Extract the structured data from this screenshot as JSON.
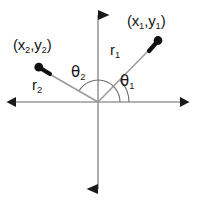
{
  "figure": {
    "width": 197,
    "height": 203,
    "background": "#ffffff",
    "axis_color": "#9a9a9a",
    "vector_color": "#9a9a9a",
    "arc_color": "#6f6f6f",
    "marker_color": "#111111",
    "text_color": "#161616"
  },
  "axes": {
    "origin": {
      "x": 98,
      "y": 102
    },
    "horizontal": {
      "name": "x-axis",
      "x1": 12,
      "y1": 102,
      "x2": 184,
      "y2": 102,
      "arrow_left": true,
      "arrow_right": true
    },
    "vertical": {
      "name": "y-axis",
      "x1": 98,
      "y1": 10,
      "x2": 98,
      "y2": 194,
      "arrow_up": true,
      "arrow_down": true
    }
  },
  "vectors": [
    {
      "id": "r1",
      "label": "r",
      "subscript": "1",
      "point_label_open": "(x",
      "point_sub_1": "1",
      "point_mid": ",y",
      "point_sub_2": "1",
      "point_label_close": ")",
      "from": {
        "x": 98,
        "y": 102
      },
      "to": {
        "x": 156,
        "y": 43
      },
      "angle_deg": 45,
      "label_pos": {
        "x": 110,
        "y": 42
      },
      "point_label_pos": {
        "x": 127,
        "y": 13
      }
    },
    {
      "id": "r2",
      "label": "r",
      "subscript": "2",
      "point_label_open": "(x",
      "point_sub_1": "2",
      "point_mid": ",y",
      "point_sub_2": "2",
      "point_label_close": ")",
      "from": {
        "x": 98,
        "y": 102
      },
      "to": {
        "x": 41,
        "y": 69
      },
      "angle_deg": 150,
      "label_pos": {
        "x": 32,
        "y": 77
      },
      "point_label_pos": {
        "x": 13,
        "y": 37
      }
    }
  ],
  "angles": [
    {
      "id": "theta1",
      "symbol": "θ",
      "subscript": "1",
      "arc_radius": 31,
      "from_deg": 0,
      "to_deg": 45,
      "label_pos": {
        "x": 120,
        "y": 73
      }
    },
    {
      "id": "theta2",
      "symbol": "θ",
      "subscript": "2",
      "arc_radius": 22,
      "from_deg": 0,
      "to_deg": 150,
      "label_pos": {
        "x": 71,
        "y": 64
      }
    }
  ]
}
